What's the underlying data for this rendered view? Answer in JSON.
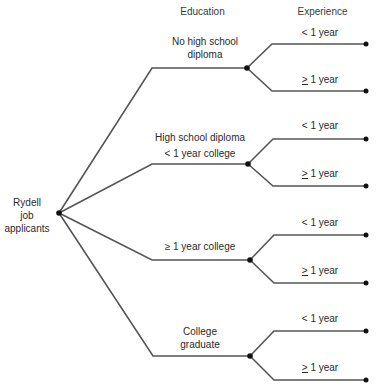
{
  "headers": {
    "education": "Education",
    "experience": "Experience"
  },
  "root": {
    "line1": "Rydell",
    "line2": "job",
    "line3": "applicants"
  },
  "education_branches": [
    {
      "line1": "No high school",
      "line2": "diploma"
    },
    {
      "line1": "High school diploma",
      "line2": "< 1 year college"
    },
    {
      "line1": "≥ 1 year college",
      "line2": ""
    },
    {
      "line1": "College",
      "line2": "graduate"
    }
  ],
  "experience_branches": {
    "less": "< 1 year",
    "more_symbol": ">",
    "more_text": " 1 year"
  },
  "colors": {
    "line": "#555555",
    "node": "#111111"
  }
}
